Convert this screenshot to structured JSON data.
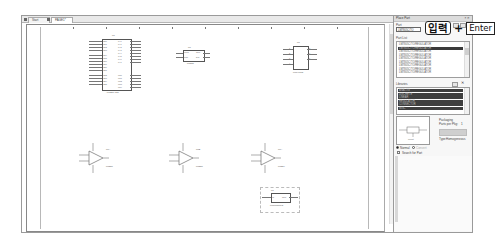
{
  "schematic_window": {
    "tabs": [
      {
        "label": "Start",
        "active": false
      },
      {
        "label": "PAGE1*",
        "active": true
      }
    ],
    "ruler_labels": [
      "1",
      "2",
      "3",
      "4",
      "5",
      "6",
      "7",
      "8",
      "9",
      "10"
    ]
  },
  "schematic": {
    "parts": [
      {
        "refdes": "U?",
        "value": "ATMEGA128",
        "kind": "mcu",
        "left_pins": [
          "PE0",
          "PE1",
          "PE2",
          "PE3",
          "PE4",
          "PE5",
          "PE6",
          "PE7",
          "PB0",
          "PB1",
          "PB2",
          "PB3",
          "PB4",
          "PB5",
          "PB6",
          "PB7"
        ],
        "right_pins": [
          "PA0",
          "PA1",
          "PA2",
          "PA3",
          "PA4",
          "PA5",
          "PA6",
          "PA7",
          "PC0",
          "PC1",
          "PC2",
          "PC3",
          "PC4",
          "PC5",
          "PC6",
          "PC7"
        ]
      },
      {
        "refdes": "U?",
        "value": "LM555",
        "kind": "small-ic",
        "left_pins": [
          "TRIG",
          "RST"
        ],
        "right_pins": [
          "OUT",
          "DIS"
        ]
      },
      {
        "refdes": "U?",
        "value": "LM741/TO",
        "kind": "dip8",
        "left_pins": [
          "1",
          "2",
          "3",
          "4"
        ],
        "right_pins": [
          "8",
          "7",
          "6",
          "5"
        ]
      },
      {
        "refdes": "U?A",
        "value": "LM358",
        "kind": "opamp",
        "unit": "+",
        "pins": [
          "3",
          "2",
          "1",
          "8",
          "4"
        ]
      },
      {
        "refdes": "U?B",
        "value": "LM358",
        "kind": "opamp",
        "unit": "+",
        "pins": [
          "5",
          "6",
          "7",
          "8",
          "4"
        ]
      },
      {
        "refdes": "U?A",
        "value": "LM324",
        "kind": "opamp",
        "unit": "+",
        "pins": [
          "3",
          "2",
          "1",
          "4",
          "11"
        ]
      },
      {
        "refdes": "U?",
        "value": "LM7805C/TO",
        "kind": "regulator",
        "left_pin_label": "IN",
        "right_pin_label": "OUT",
        "pins": [
          "1",
          "3",
          "2"
        ]
      }
    ]
  },
  "place_part_panel": {
    "title": "Place Part",
    "part_label": "Part",
    "part_input_value": "LM7805C/TO",
    "part_list_label": "Part List",
    "part_list": [
      "LM7805C/TO/REGULATOR",
      "LM7805C/TO/REGULATOR",
      "LM7805C/TO/REGULATOR",
      "LM7805C/TO/REGULATOR",
      "LM7805C/TO/REGULATOR",
      "LM7805C/TO/REGULATOR",
      "LM7805C/TO/REGULATOR",
      "LM7805C/TO/REGULATOR",
      "LM7805C/TO/REGULATOR"
    ],
    "part_list_selected_index": 1,
    "libraries_label": "Libraries",
    "libraries": [
      "ANALOG",
      "DISCRETE",
      "LINEAR",
      "REGULATOR",
      "CONNECTOR",
      "MISC"
    ],
    "preview_caption": "Pinout",
    "packaging_label": "Packaging",
    "parts_per_pkg_label": "Parts per Pkg:",
    "parts_per_pkg_value": "1",
    "part_label2": "Part:",
    "type_label": "Type:",
    "type_value": "Homogeneous",
    "normal_label": "Normal",
    "convert_label": "Convert",
    "search_label": "Search for Part"
  },
  "annotation": {
    "text": "입력",
    "plus": "+",
    "key": "Enter"
  }
}
